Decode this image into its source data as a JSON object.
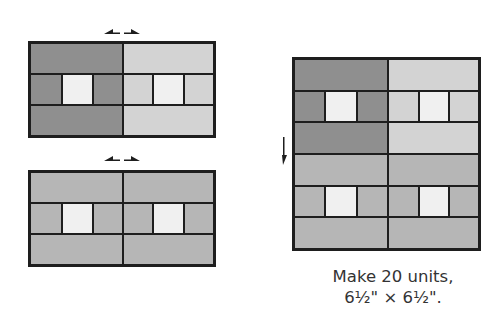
{
  "colors": {
    "dark": "#8f8f8f",
    "medium": "#b6b6b6",
    "light": "#d3d3d3",
    "center": "#f0f0f0",
    "line": "#1e1e1e"
  },
  "diagram": {
    "top_unit": {
      "left_fabric": "dark",
      "right_fabric": "light",
      "press_arrow": "outward-left-right"
    },
    "bottom_unit": {
      "left_fabric": "medium",
      "right_fabric": "medium",
      "press_arrow": "outward-left-right"
    },
    "assembled_unit": {
      "press_arrow": "down"
    }
  },
  "caption": {
    "line1": "Make 20 units,",
    "line2": "6½\" × 6½\"."
  }
}
